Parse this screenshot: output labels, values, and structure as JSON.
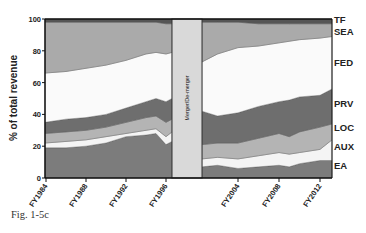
{
  "figure": {
    "caption": "Fig. 1-5c"
  },
  "chart_data": {
    "type": "area",
    "stacked": true,
    "title": "",
    "xlabel": "",
    "ylabel": "% of total revenue",
    "ylim": [
      0,
      100
    ],
    "yticks": [
      0,
      20,
      40,
      60,
      80,
      100
    ],
    "xtick_labels_left": [
      "FY1984",
      "FY1988",
      "FY1992",
      "FY1996"
    ],
    "xtick_labels_right": [
      "FY2004",
      "FY2008",
      "FY2012"
    ],
    "gap_annotation": "Merger/De-merger",
    "grid": false,
    "legend_position": "right (inline labels)",
    "series_order_bottom_to_top": [
      "EA",
      "AUX",
      "LOC",
      "PRV",
      "FED",
      "SEA",
      "TF"
    ],
    "series_colors": {
      "EA": "#7c7c7c",
      "AUX": "#f4f4f4",
      "LOC": "#b4b4b4",
      "PRV": "#6e6e6e",
      "FED": "#fafafa",
      "SEA": "#aaaaaa",
      "TF": "#555555"
    },
    "segments": [
      {
        "name": "pre-merger",
        "x": [
          1984,
          1986,
          1988,
          1990,
          1992,
          1994,
          1995,
          1996,
          1997
        ],
        "cumulative_top": {
          "EA": [
            19,
            19,
            20,
            22,
            26,
            27,
            28,
            21,
            23
          ],
          "AUX": [
            22,
            23,
            24,
            26,
            28,
            30,
            31,
            26,
            29
          ],
          "LOC": [
            28,
            29,
            30,
            32,
            35,
            38,
            39,
            35,
            37
          ],
          "PRV": [
            35,
            37,
            38,
            40,
            44,
            48,
            50,
            48,
            50
          ],
          "FED": [
            66,
            67,
            69,
            71,
            74,
            78,
            79,
            78,
            79
          ],
          "SEA": [
            98,
            98,
            98,
            98,
            98,
            98,
            98,
            97,
            97
          ],
          "TF": [
            100,
            100,
            100,
            100,
            100,
            100,
            100,
            100,
            100
          ]
        }
      },
      {
        "name": "post-merger",
        "x": [
          2001,
          2002,
          2004,
          2006,
          2008,
          2009,
          2010,
          2012,
          2013
        ],
        "cumulative_top": {
          "EA": [
            7,
            8,
            6,
            7,
            8,
            7,
            9,
            11,
            11
          ],
          "AUX": [
            12,
            13,
            12,
            14,
            16,
            15,
            16,
            18,
            24
          ],
          "LOC": [
            21,
            22,
            22,
            25,
            28,
            26,
            29,
            32,
            34
          ],
          "PRV": [
            42,
            39,
            41,
            45,
            48,
            49,
            51,
            52,
            56
          ],
          "FED": [
            73,
            78,
            82,
            83,
            85,
            86,
            87,
            88,
            89
          ],
          "SEA": [
            98,
            98,
            98,
            97,
            97,
            97,
            97,
            97,
            97
          ],
          "TF": [
            100,
            100,
            100,
            100,
            100,
            100,
            100,
            100,
            100
          ]
        }
      }
    ]
  }
}
